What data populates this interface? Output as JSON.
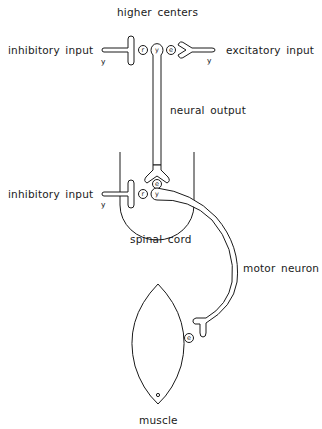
{
  "diagram": {
    "title": "higher centers",
    "labels": {
      "inhibitory_input_top": "inhibitory input",
      "excitatory_input_top": "excitatory input",
      "neural_output": "neural output",
      "inhibitory_input_spinal": "inhibitory input",
      "spinal_cord": "spinal cord",
      "motor_neuron": "motor neuron",
      "muscle": "muscle"
    },
    "synapse_glyphs": {
      "top_inhibitory_fiber": "y",
      "top_excitatory_fiber": "y",
      "top_receptor_left": "r",
      "top_neuron_body": "y",
      "top_receptor_right": "e",
      "spinal_receptor_top": "e",
      "spinal_inhibitory_fiber": "y",
      "spinal_receptor_left": "r",
      "spinal_neuron_body": "y",
      "muscle_receptor": "e"
    },
    "colors": {
      "line": "#1a1a1a",
      "background": "#ffffff"
    }
  }
}
